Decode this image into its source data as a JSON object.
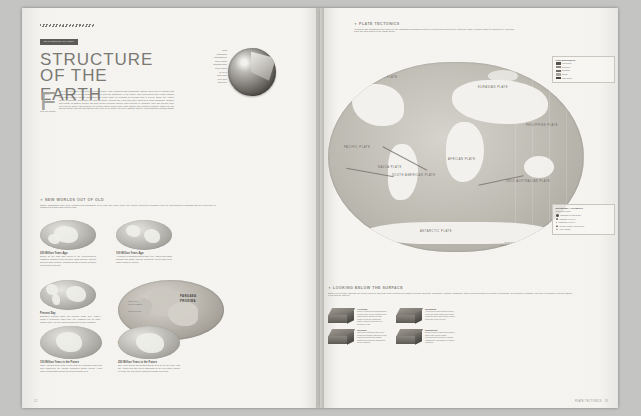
{
  "left": {
    "badge": "EXPLORING PLANET",
    "title_line1": "STRUCTURE",
    "title_line2": "OF THE EARTH",
    "dropcap": "F",
    "intro": "rom a hot inner core to a crust of shifting plates, from volcanoes and avalanches, Earth's layers are in constant and dynamic. Tectonic unites, jigsaw together to form the lithosphere of the planet. Their movements have slowly shaped continents into the familiar landmasses we know today, all recorded by geologic time to reveal. Today, the Atlantic Ocean is widening, suggesting the long-ago North America and Africa once were joined as a single landmass. Weather and climate on Earth's surface can have deeper geologic causes: plate motions in Himalaya, uplift and old-age tend. Let's look at where vast pressure on tectonic plates brings rising earth quakes and volcanic eruptions. Down low, the shifting weight from melting glaciers has even let all history the fall of Earth's layers—a phenomenon remains hidden from our surface.",
    "globe_interior_labels": [
      "Crust",
      "Lithosphere",
      "Asthenosphere",
      "Upper Mantle",
      "Transition Zone",
      "Lower Mantle",
      "D'' Layer",
      "Outer Core",
      "Inner Core",
      "Solid Core"
    ],
    "worlds_heading": "NEW WORLDS OUT OF OLD",
    "worlds_intro": "Earth's landmasses have been colliding and rearranging for at least two billion years. The current continents separated from the supercontinent Pangaea and will reconverge in Pangaea Proxima in 250 million years.",
    "panels": [
      {
        "title": "200 Million Years Ago",
        "body": "Nearly all the land was joined in the supercontinent Pangaea. Climates were generally warm and dry; deserts covered wide interiors. Pangaea began to break up about 175 million years ago."
      },
      {
        "title": "100 Million Years Ago",
        "body": "As pieces of Pangaea drifted apart, the Atlantic and Indian Oceans took shape, and the continents, as we know them today, began to emerge."
      },
      {
        "title": "Present Day",
        "body": "Displaced tectonic plates are ongoing today. The Atlantic grows a centimeter each year; the Himalaya rise as India collides with Asia; the Pacific shrinks as its crust subducts."
      },
      {
        "title": "Pangaea Proxima",
        "body": "In 250 million years the continents may again fuse into a single supercontinent, tentatively named Pangaea Proxima."
      },
      {
        "title": "100 Million Years in the Future",
        "body": "What Australia drifts north to spin near the collapsing basin that now constitutes the world's remaining Tethys trench; Africa slides into Eurasia closing the Mediterranean Sea."
      },
      {
        "title": "250 Million Years in the Future",
        "body": "The Arctic Ocean and Mediterranean Sea are all but gone, and the Atlantic will have been subsumed by an even wider merger to create the new super-continent Pangaea Proxima."
      }
    ],
    "pangaea_label_line1": "PANGAEA",
    "pangaea_label_line2": "PROXIMA",
    "pangaea_legend": [
      "Future Land",
      "Present Coastline",
      "Subduction Zone"
    ],
    "page_number": "12"
  },
  "right": {
    "tectonics_heading": "PLATE TECTONICS",
    "tectonics_body": "Volcanoes and earthquakes hot spots line the established boundaries between tectonic plates such as the Great Rift Valley, Iceland, within the continent of Africa and along the Java Trench in the Indian Ocean.",
    "plate_labels": [
      "NORTH AMERICAN PLATE",
      "EURASIAN PLATE",
      "PACIFIC PLATE",
      "SOUTH AMERICAN PLATE",
      "AFRICAN PLATE",
      "INDO-AUSTRALIAN PLATE",
      "ANTARCTIC PLATE",
      "NAZCA PLATE",
      "COCOS PLATE",
      "CARIBBEAN PLATE",
      "SCOTIA PLATE",
      "ARABIAN PLATE",
      "PHILIPPINE PLATE",
      "JUAN DE FUCA PLATE"
    ],
    "plate_boundaries_legend": {
      "title": "Plate Boundaries",
      "items": [
        {
          "label": "Convergent",
          "desc": "Plates move toward each other; one plate dives beneath the other",
          "color": "#55524d"
        },
        {
          "label": "Divergent",
          "desc": "Plates pull apart; new crust forms along the rift",
          "color": "#8b8780"
        },
        {
          "label": "Transform",
          "desc": "Plates slide horizontally past one another",
          "color": "#6e6b65"
        },
        {
          "label": "Diffuse",
          "desc": "Broad zone of deformation between plates",
          "color": "#a9a69f"
        },
        {
          "label": "Plate motion",
          "desc": "Arrow shows relative direction and speed of motion",
          "color": "#44423d"
        }
      ]
    },
    "quake_legend": {
      "title": "Earthquake / Volcanoes",
      "subtitle": "of the Past Century",
      "items": [
        {
          "label": "Magnitude 8.0 and greater",
          "symbol": "circle-large"
        },
        {
          "label": "Magnitude 7.0 to 7.9",
          "symbol": "circle-medium"
        },
        {
          "label": "Magnitude 6.0 to 6.9",
          "symbol": "circle-small"
        },
        {
          "label": "Volcanic eruption, 1900 to 2010",
          "symbol": "triangle"
        },
        {
          "label": "Active volcano",
          "symbol": "triangle-open"
        }
      ]
    },
    "scale_label": "SCALE 1:95,000,000",
    "projection_label": "WINKEL TRIPEL PROJECTION",
    "below_heading": "LOOKING BELOW THE SURFACE",
    "below_body": "Earth is never static. Beneath our forests, deserts, and seas, plate tectonics are always in motion. Buckling, separating, colliding, smashing—these forces determine the height of mountains, the strength of tsunamis, the heat of volcanoes, and the stability of the land we walk on.",
    "surface_items": [
      {
        "title": "Accretion",
        "body": "Where a continent meets subducting oceanic crust, slivers of seafloor and island arcs are scraped off and plastered onto the continental margin, adding new terrain over millions of years."
      },
      {
        "title": "Spreading",
        "body": "At mid-ocean ridges magma rises to fill the gap as two plates move apart, cooling to form fresh oceanic crust on either side of the rift valley."
      },
      {
        "title": "Collision",
        "body": "When two continental plates meet, neither will subduct; instead the crust crumples and thickens upward, raising great mountain ranges such as the Himalaya."
      },
      {
        "title": "Subduction",
        "body": "Dense oceanic crust dives beneath a lighter plate into the mantle, generating deep trenches, powerful earthquakes, and chains of explosive volcanoes."
      }
    ],
    "footer_text": "PLATE TECTONICS",
    "page_number": "13"
  }
}
